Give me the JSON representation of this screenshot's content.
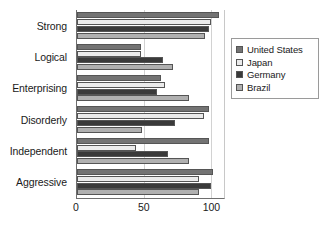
{
  "chart_data": {
    "type": "bar",
    "orientation": "horizontal",
    "title": "",
    "xlabel": "",
    "ylabel": "",
    "xlim": [
      0,
      110
    ],
    "xticks": [
      0,
      50,
      100
    ],
    "xtick_labels": [
      "0",
      "50",
      "100"
    ],
    "grid": true,
    "grid_axis": "x",
    "legend_position": "right",
    "categories": [
      "Strong",
      "Logical",
      "Enterprising",
      "Disorderly",
      "Independent",
      "Aggressive"
    ],
    "series": [
      {
        "name": "United States",
        "color": "#737373",
        "values": [
          106,
          48,
          63,
          99,
          99,
          102
        ]
      },
      {
        "name": "Japan",
        "color": "#ebebeb",
        "values": [
          100,
          48,
          66,
          95,
          44,
          91
        ]
      },
      {
        "name": "Germany",
        "color": "#3a3a3a",
        "values": [
          99,
          64,
          60,
          73,
          68,
          100
        ]
      },
      {
        "name": "Brazil",
        "color": "#b0b0b0",
        "values": [
          96,
          72,
          84,
          49,
          84,
          91
        ]
      }
    ]
  },
  "legend": {
    "items": [
      {
        "label": "United States",
        "color": "#737373"
      },
      {
        "label": "Japan",
        "color": "#ebebeb"
      },
      {
        "label": "Germany",
        "color": "#3a3a3a"
      },
      {
        "label": "Brazil",
        "color": "#b0b0b0"
      }
    ]
  },
  "colors": {
    "axis": "#6e6e6e",
    "gridline": "#d2d2d2",
    "text": "#1a1a1a",
    "bar_border": "#555555",
    "legend_border": "#9a9a9a",
    "background": "#ffffff"
  }
}
